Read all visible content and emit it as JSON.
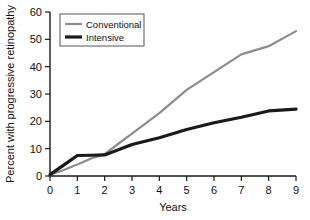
{
  "chart_data": {
    "type": "line",
    "title": "",
    "xlabel": "Years",
    "ylabel": "Percent with progressive retinopathy",
    "xlim": [
      0,
      9
    ],
    "ylim": [
      0,
      60
    ],
    "xticks": [
      "0",
      "1",
      "2",
      "3",
      "4",
      "5",
      "6",
      "7",
      "8",
      "9"
    ],
    "yticks": [
      "0",
      "10",
      "20",
      "30",
      "40",
      "50",
      "60"
    ],
    "grid": false,
    "legend_position": "top-left",
    "x": [
      0,
      0.5,
      1,
      1.5,
      2,
      2.5,
      3,
      4,
      5,
      6,
      7,
      8,
      9
    ],
    "series": [
      {
        "name": "Conventional",
        "color": "#8c8c8c",
        "width": 2.2,
        "values": [
          0.5,
          2.2,
          4.2,
          6.4,
          8.0,
          11.8,
          15.5,
          23.0,
          31.5,
          38.0,
          44.5,
          47.5,
          53.0
        ]
      },
      {
        "name": "Intensive",
        "color": "#1a1a1a",
        "width": 3.2,
        "values": [
          0.5,
          4.0,
          7.5,
          7.6,
          7.7,
          9.6,
          11.5,
          14.0,
          17.0,
          19.5,
          21.5,
          23.8,
          24.5
        ]
      }
    ]
  },
  "legend": {
    "items": [
      {
        "label": "Conventional"
      },
      {
        "label": "Intensive"
      }
    ]
  },
  "axes": {
    "x_title": "Years",
    "y_title": "Percent with progressive retinopathy"
  }
}
